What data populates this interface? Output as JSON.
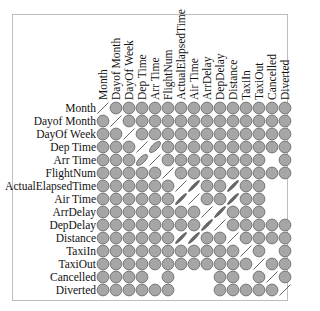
{
  "chart_data": {
    "type": "heatmap",
    "subtype": "correlation-matrix-ellipse",
    "title": "",
    "variables": [
      "Month",
      "Dayof Month",
      "DayOf Week",
      "Dep Time",
      "Arr Time",
      "FlightNum",
      "ActualElapsedTime",
      "Air Time",
      "ArrDelay",
      "DepDelay",
      "Distance",
      "TaxiIn",
      "TaxiOut",
      "Cancelled",
      "Diverted"
    ],
    "row_labels": [
      "Month",
      "Dayof Month",
      "DayOf Week",
      "Dep Time",
      "Arr Time",
      "FlightNum",
      "ActualElapsedTime",
      "Air Time",
      "ArrDelay",
      "DepDelay",
      "Distance",
      "TaxiIn",
      "TaxiOut",
      "Cancelled",
      "Diverted"
    ],
    "col_labels": [
      "Month",
      "Dayof Month",
      "DayOf Week",
      "Dep Time",
      "Arr Time",
      "FlightNum",
      "ActualElapsedTime",
      "Air Time",
      "ArrDelay",
      "DepDelay",
      "Distance",
      "TaxiIn",
      "TaxiOut",
      "Cancelled",
      "Diverted"
    ],
    "legend": "none",
    "grid": false,
    "cell_shape_key": {
      "C": "circle (near-zero correlation)",
      "L": "thin line (|r|≈1)",
      "D": "dark thin ellipse (strong correlation)",
      "E": "ellipse (moderate correlation)",
      "_": "blank (NA)"
    },
    "matrix": [
      [
        "L",
        "C",
        "C",
        "C",
        "C",
        "C",
        "C",
        "C",
        "C",
        "C",
        "C",
        "C",
        "C",
        "C",
        "C"
      ],
      [
        "C",
        "L",
        "C",
        "C",
        "C",
        "C",
        "C",
        "C",
        "C",
        "C",
        "C",
        "C",
        "C",
        "C",
        "C"
      ],
      [
        "C",
        "C",
        "L",
        "C",
        "C",
        "C",
        "C",
        "C",
        "C",
        "C",
        "C",
        "C",
        "C",
        "C",
        "C"
      ],
      [
        "C",
        "C",
        "C",
        "L",
        "E",
        "C",
        "C",
        "C",
        "C",
        "C",
        "C",
        "C",
        "C",
        "C",
        "C"
      ],
      [
        "C",
        "C",
        "C",
        "E",
        "L",
        "C",
        "C",
        "C",
        "C",
        "C",
        "C",
        "C",
        "C",
        "_",
        "C"
      ],
      [
        "C",
        "C",
        "C",
        "C",
        "C",
        "L",
        "C",
        "C",
        "C",
        "C",
        "C",
        "C",
        "C",
        "C",
        "C"
      ],
      [
        "C",
        "C",
        "C",
        "C",
        "C",
        "C",
        "L",
        "D",
        "C",
        "C",
        "D",
        "C",
        "C",
        "_",
        "_"
      ],
      [
        "C",
        "C",
        "C",
        "C",
        "C",
        "C",
        "D",
        "L",
        "C",
        "C",
        "D",
        "C",
        "C",
        "_",
        "_"
      ],
      [
        "C",
        "C",
        "C",
        "C",
        "C",
        "C",
        "C",
        "C",
        "L",
        "D",
        "C",
        "C",
        "C",
        "_",
        "_"
      ],
      [
        "C",
        "C",
        "C",
        "C",
        "C",
        "C",
        "C",
        "C",
        "D",
        "L",
        "C",
        "C",
        "C",
        "C",
        "C"
      ],
      [
        "C",
        "C",
        "C",
        "C",
        "C",
        "C",
        "D",
        "D",
        "C",
        "C",
        "L",
        "C",
        "C",
        "C",
        "C"
      ],
      [
        "C",
        "C",
        "C",
        "C",
        "C",
        "C",
        "C",
        "C",
        "C",
        "C",
        "C",
        "L",
        "C",
        "_",
        "C"
      ],
      [
        "C",
        "C",
        "C",
        "C",
        "C",
        "C",
        "C",
        "C",
        "C",
        "C",
        "C",
        "C",
        "L",
        "C",
        "C"
      ],
      [
        "C",
        "C",
        "C",
        "C",
        "_",
        "C",
        "_",
        "_",
        "_",
        "C",
        "C",
        "_",
        "C",
        "L",
        "C"
      ],
      [
        "C",
        "C",
        "C",
        "C",
        "C",
        "C",
        "_",
        "_",
        "_",
        "C",
        "C",
        "C",
        "C",
        "C",
        "L"
      ]
    ],
    "approx_correlations": {
      "DepTime~ArrTime": 0.7,
      "ActualElapsedTime~AirTime": 0.98,
      "ActualElapsedTime~Distance": 0.95,
      "AirTime~Distance": 0.97,
      "ArrDelay~DepDelay": 0.93
    },
    "colors": {
      "circle_fill": "#a6a6a6",
      "circle_stroke": "#6e6e6e",
      "line": "#555555",
      "strong_line": "#4a4a4a"
    }
  }
}
